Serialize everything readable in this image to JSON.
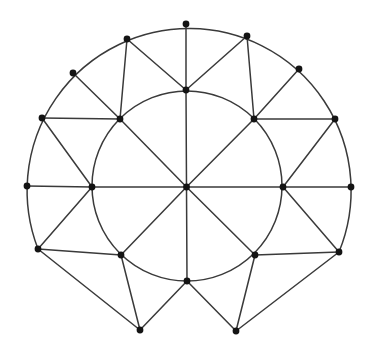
{
  "diagram": {
    "type": "planar-graph",
    "colors": {
      "stroke": "#3a3a3a",
      "node": "#141414",
      "background": "#ffffff"
    },
    "inner_circle": {
      "cx": 187,
      "cy": 186,
      "r": 95
    },
    "outer_arc": {
      "cx": 189,
      "cy": 186,
      "r": 162,
      "from": "O13",
      "to": "O6"
    },
    "nodes": [
      {
        "id": "C",
        "x": 186.5,
        "y": 187
      },
      {
        "id": "I0",
        "x": 186,
        "y": 90
      },
      {
        "id": "I1",
        "x": 254,
        "y": 119
      },
      {
        "id": "I2",
        "x": 283,
        "y": 187
      },
      {
        "id": "I3",
        "x": 255,
        "y": 255
      },
      {
        "id": "I4",
        "x": 187,
        "y": 281
      },
      {
        "id": "I5",
        "x": 121,
        "y": 255
      },
      {
        "id": "I6",
        "x": 92,
        "y": 187
      },
      {
        "id": "I7",
        "x": 120,
        "y": 119
      },
      {
        "id": "O0",
        "x": 186,
        "y": 24
      },
      {
        "id": "O1",
        "x": 247,
        "y": 36
      },
      {
        "id": "O2",
        "x": 299,
        "y": 69
      },
      {
        "id": "O3",
        "x": 335,
        "y": 119
      },
      {
        "id": "O4",
        "x": 351,
        "y": 187
      },
      {
        "id": "O5",
        "x": 339,
        "y": 252
      },
      {
        "id": "B1",
        "x": 236,
        "y": 331
      },
      {
        "id": "B0",
        "x": 140,
        "y": 330
      },
      {
        "id": "O8",
        "x": 38,
        "y": 249
      },
      {
        "id": "O9",
        "x": 27,
        "y": 186
      },
      {
        "id": "O10",
        "x": 42,
        "y": 118
      },
      {
        "id": "O11",
        "x": 73,
        "y": 73
      },
      {
        "id": "O12",
        "x": 127,
        "y": 39
      }
    ],
    "edges": [
      [
        "C",
        "I0"
      ],
      [
        "C",
        "I1"
      ],
      [
        "C",
        "I2"
      ],
      [
        "C",
        "I3"
      ],
      [
        "C",
        "I4"
      ],
      [
        "C",
        "I5"
      ],
      [
        "C",
        "I6"
      ],
      [
        "C",
        "I7"
      ],
      [
        "I0",
        "O0"
      ],
      [
        "I0",
        "O12"
      ],
      [
        "I0",
        "O1"
      ],
      [
        "I7",
        "O12"
      ],
      [
        "I7",
        "O11"
      ],
      [
        "I7",
        "O10"
      ],
      [
        "I1",
        "O1"
      ],
      [
        "I1",
        "O2"
      ],
      [
        "I1",
        "O3"
      ],
      [
        "I6",
        "O10"
      ],
      [
        "I6",
        "O9"
      ],
      [
        "I6",
        "O8"
      ],
      [
        "I2",
        "O3"
      ],
      [
        "I2",
        "O4"
      ],
      [
        "I2",
        "O5"
      ],
      [
        "I5",
        "O8"
      ],
      [
        "I5",
        "B0"
      ],
      [
        "I3",
        "O5"
      ],
      [
        "I3",
        "B1"
      ],
      [
        "I4",
        "B0"
      ],
      [
        "I4",
        "B1"
      ],
      [
        "O8",
        "B0"
      ],
      [
        "O5",
        "B1"
      ]
    ]
  }
}
